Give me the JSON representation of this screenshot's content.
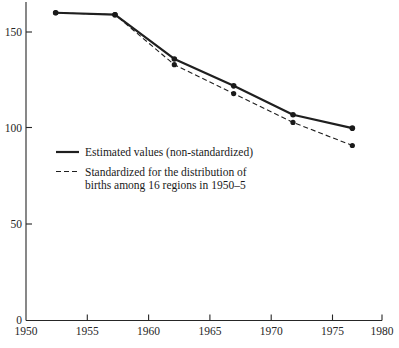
{
  "chart_data": {
    "type": "line",
    "title": "",
    "subtitle": "",
    "xlabel": "",
    "ylabel": "",
    "x": [
      1952.5,
      1957.5,
      1962.5,
      1967.5,
      1972.5,
      1977.5
    ],
    "xlim": [
      1950,
      1980
    ],
    "ylim": [
      0,
      160
    ],
    "grid": false,
    "legend_position": "inside-center-left",
    "x_ticks": [
      1950,
      1955,
      1960,
      1965,
      1970,
      1975,
      1980
    ],
    "x_tick_labels": [
      "1950",
      "1955",
      "1960",
      "1965",
      "1970",
      "1975",
      "1980"
    ],
    "y_ticks": [
      0,
      50,
      100,
      150
    ],
    "y_tick_labels": [
      "0",
      "50",
      "100",
      "150"
    ],
    "series": [
      {
        "name": "Estimated values (non-standardized)",
        "style": "solid",
        "color": "#1f1f1f",
        "markers": true,
        "values": [
          160,
          159,
          136,
          122,
          107,
          100
        ]
      },
      {
        "name": "Standardized for the distribution of births among 16 regions in 1950–5",
        "style": "dashed",
        "color": "#1f1f1f",
        "markers": true,
        "values": [
          160,
          159,
          133,
          118,
          103,
          91
        ]
      }
    ]
  },
  "legend": {
    "entries": [
      {
        "swatch": "solid-line",
        "line1": "Estimated values (non-standardized)",
        "line2": ""
      },
      {
        "swatch": "dashed-line",
        "line1": "Standardized for the distribution of",
        "line2": "births among 16 regions in 1950–5"
      }
    ]
  },
  "axes": {
    "y_tick_labels": [
      "150",
      "100",
      "50",
      "0"
    ],
    "x_tick_labels": [
      "1950",
      "1955",
      "1960",
      "1965",
      "1970",
      "1975",
      "1980"
    ]
  }
}
